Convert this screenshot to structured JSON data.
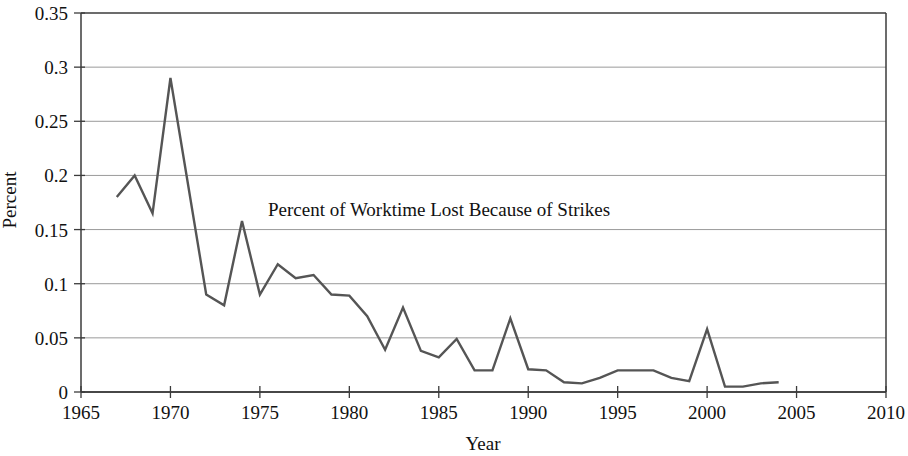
{
  "chart_data": {
    "type": "line",
    "title": "Percent of Worktime Lost Because of Strikes",
    "xlabel": "Year",
    "ylabel": "Percent",
    "xlim": [
      1965,
      2010
    ],
    "ylim": [
      0,
      0.35
    ],
    "grid": true,
    "legend": "none",
    "xticks": [
      1965,
      1970,
      1975,
      1980,
      1985,
      1990,
      1995,
      2000,
      2005,
      2010
    ],
    "xtick_labels": [
      "1965",
      "1970",
      "1975",
      "1980",
      "1985",
      "1990",
      "1995",
      "2000",
      "2005",
      "2010"
    ],
    "yticks": [
      0,
      0.05,
      0.1,
      0.15,
      0.2,
      0.25,
      0.3,
      0.35
    ],
    "ytick_labels": [
      "0",
      "0.05",
      "0.1",
      "0.15",
      "0.2",
      "0.25",
      "0.3",
      "0.35"
    ],
    "x": [
      1967,
      1968,
      1969,
      1970,
      1971,
      1972,
      1973,
      1974,
      1975,
      1976,
      1977,
      1978,
      1979,
      1980,
      1981,
      1982,
      1983,
      1984,
      1985,
      1986,
      1987,
      1988,
      1989,
      1990,
      1991,
      1992,
      1993,
      1994,
      1995,
      1996,
      1997,
      1998,
      1999,
      2000,
      2001,
      2002,
      2003,
      2004
    ],
    "values": [
      0.18,
      0.2,
      0.165,
      0.29,
      0.19,
      0.09,
      0.08,
      0.158,
      0.09,
      0.118,
      0.105,
      0.108,
      0.09,
      0.089,
      0.07,
      0.039,
      0.078,
      0.038,
      0.032,
      0.049,
      0.02,
      0.02,
      0.068,
      0.021,
      0.02,
      0.009,
      0.008,
      0.013,
      0.02,
      0.02,
      0.02,
      0.013,
      0.01,
      0.058,
      0.005,
      0.005,
      0.008,
      0.009
    ],
    "series_name": "Percent of Worktime Lost Because of Strikes",
    "line_color": "#555555",
    "grid_color": "#9a9a9a",
    "axis_color": "#3b3b3b"
  }
}
